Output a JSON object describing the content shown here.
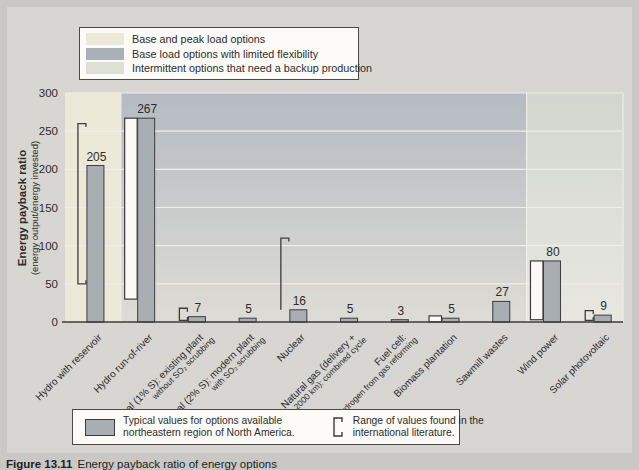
{
  "colors": {
    "page_bg": "#c9c8c5",
    "figure_bg": "#d7d6d2",
    "axis": "#3c3c3c",
    "text": "#2c2c2c",
    "grid": "#efeee8",
    "bar_fill": "#a9aeb2",
    "range_fill": "#fbfaf6"
  },
  "top_legend": {
    "items": [
      {
        "label": "Base and peak load options",
        "color": "#ece9d8"
      },
      {
        "label": "Base load options with limited flexibility",
        "color": "#a9b0b7"
      },
      {
        "label": "Intermittent options that need a backup production",
        "color": "#dde1d5"
      }
    ]
  },
  "bottom_legend": {
    "typical_line1": "Typical values for options available",
    "typical_line2": "northeastern region of North America.",
    "range_line1": "Range of values found in the",
    "range_line2": "international literature."
  },
  "caption": {
    "label": "Figure 13.11",
    "text": "Energy payback ratio of energy options"
  },
  "chart_data": {
    "type": "bar",
    "title": "",
    "ylabel": "Energy payback ratio",
    "ylabel_sub": "(energy output/energy invested)",
    "ylim": [
      0,
      300
    ],
    "yticks": [
      0,
      50,
      100,
      150,
      200,
      250,
      300
    ],
    "grid": true,
    "legend_position": "top-and-bottom boxes",
    "categories": [
      {
        "label": "Hydro with reservoir",
        "value": 205,
        "range_low": 50,
        "range_high": 260,
        "range_style": "bracket",
        "zone": "base-peak"
      },
      {
        "label": "Hydro run-of-river",
        "value": 267,
        "range_low": 30,
        "range_high": 267,
        "range_style": "rect",
        "zone": "base-load"
      },
      {
        "label": "Coal (1% S): existing plant",
        "label2": "without SO₂ scrubbing",
        "value": 7,
        "range_low": 2,
        "range_high": 18,
        "range_style": "bracket",
        "zone": "base-load"
      },
      {
        "label": "Coal (2% S): modern plant",
        "label2": "with SO₂ scrubbing",
        "value": 5,
        "zone": "base-load"
      },
      {
        "label": "Nuclear",
        "value": 16,
        "range_low": 16,
        "range_high": 110,
        "range_style": "bracket-top",
        "zone": "base-load"
      },
      {
        "label": "Natural gas (delivery +",
        "label2": "2000 km): combined cycle",
        "value": 5,
        "zone": "base-load"
      },
      {
        "label": "Fuel cell:",
        "label2": "hydrogen from gas reforming",
        "value": 3,
        "zone": "base-load"
      },
      {
        "label": "Biomass plantation",
        "value": 5,
        "range_low": 0,
        "range_high": 8,
        "range_style": "rect",
        "zone": "base-load"
      },
      {
        "label": "Sawmill wastes",
        "value": 27,
        "zone": "base-load"
      },
      {
        "label": "Wind power",
        "value": 80,
        "range_low": 3,
        "range_high": 80,
        "range_style": "rect",
        "zone": "intermittent"
      },
      {
        "label": "Solar photovoltaic",
        "value": 9,
        "range_low": 2,
        "range_high": 15,
        "range_style": "bracket",
        "zone": "intermittent"
      }
    ],
    "zones": [
      {
        "name": "base-peak",
        "from": 0,
        "to": 0,
        "color": "#ece9d8"
      },
      {
        "name": "base-load",
        "from": 1,
        "to": 8,
        "color_top": "#b5bbc2",
        "color_bottom": "#dedcd6"
      },
      {
        "name": "intermittent",
        "from": 9,
        "to": 10,
        "color_top": "#d2d5cf",
        "color_bottom": "#e8e8e1"
      }
    ]
  }
}
